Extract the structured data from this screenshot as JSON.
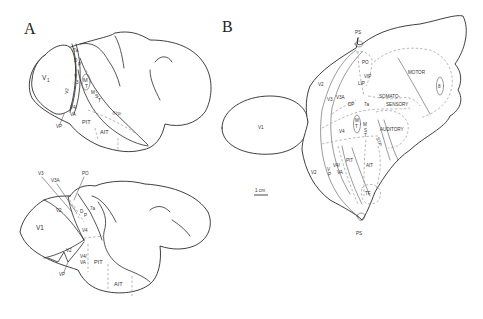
{
  "panels": {
    "A": {
      "label": "A",
      "lateral_view": {
        "areas": {
          "v1": "V",
          "v1_sub": "1",
          "a7a": "7a",
          "dp_d": "D",
          "dp_p": "P",
          "v3": "V",
          "v3_sub": "3",
          "v2": "V2",
          "mt_m": "M",
          "mt_t": "T",
          "mst_m": "M",
          "mst_s": "S",
          "mst_t": "T",
          "stp": "STP",
          "v4va": "V4/",
          "v4va2": "VA",
          "vp": "VP",
          "pit": "PIT",
          "ait": "AIT"
        }
      },
      "medial_view": {
        "areas": {
          "v3": "V3",
          "v3a": "V3A",
          "po": "PO",
          "v1": "V1",
          "v2_top": "V2",
          "dp_d": "D",
          "dp_p": "P",
          "a7a": "7a",
          "v4": "V4",
          "v2_bottom": "V2",
          "v4va": "V4/",
          "v4va2": "VA",
          "vp": "VP",
          "pit": "PIT",
          "ait": "AIT"
        }
      }
    },
    "B": {
      "label": "B",
      "areas": {
        "ps_top": "PS",
        "ps_bottom": "PS",
        "po": "PO",
        "vip": "VIP",
        "lip": "LIP",
        "motor": "MOTOR",
        "area8": "8",
        "v2_upper": "V2",
        "v3": "V3",
        "v3a": "V3A",
        "dp": "DP",
        "a7a": "7a",
        "somato1": "SOMATO-",
        "somato2": "SENSORY",
        "v1": "V1",
        "mt_m": "M",
        "mt_t": "T",
        "mst_m": "M",
        "mst_s": "S",
        "mst_t": "T",
        "v4": "V4",
        "auditory": "AUDITORY",
        "stp": "STP",
        "pit": "PIT",
        "ait": "AIT",
        "v2_lower": "V2",
        "vp_v": "V",
        "vp_p": "P",
        "v4va": "V4/",
        "v4va2": "VA",
        "tf": "TF"
      },
      "scale_bar": "1 cm"
    }
  }
}
